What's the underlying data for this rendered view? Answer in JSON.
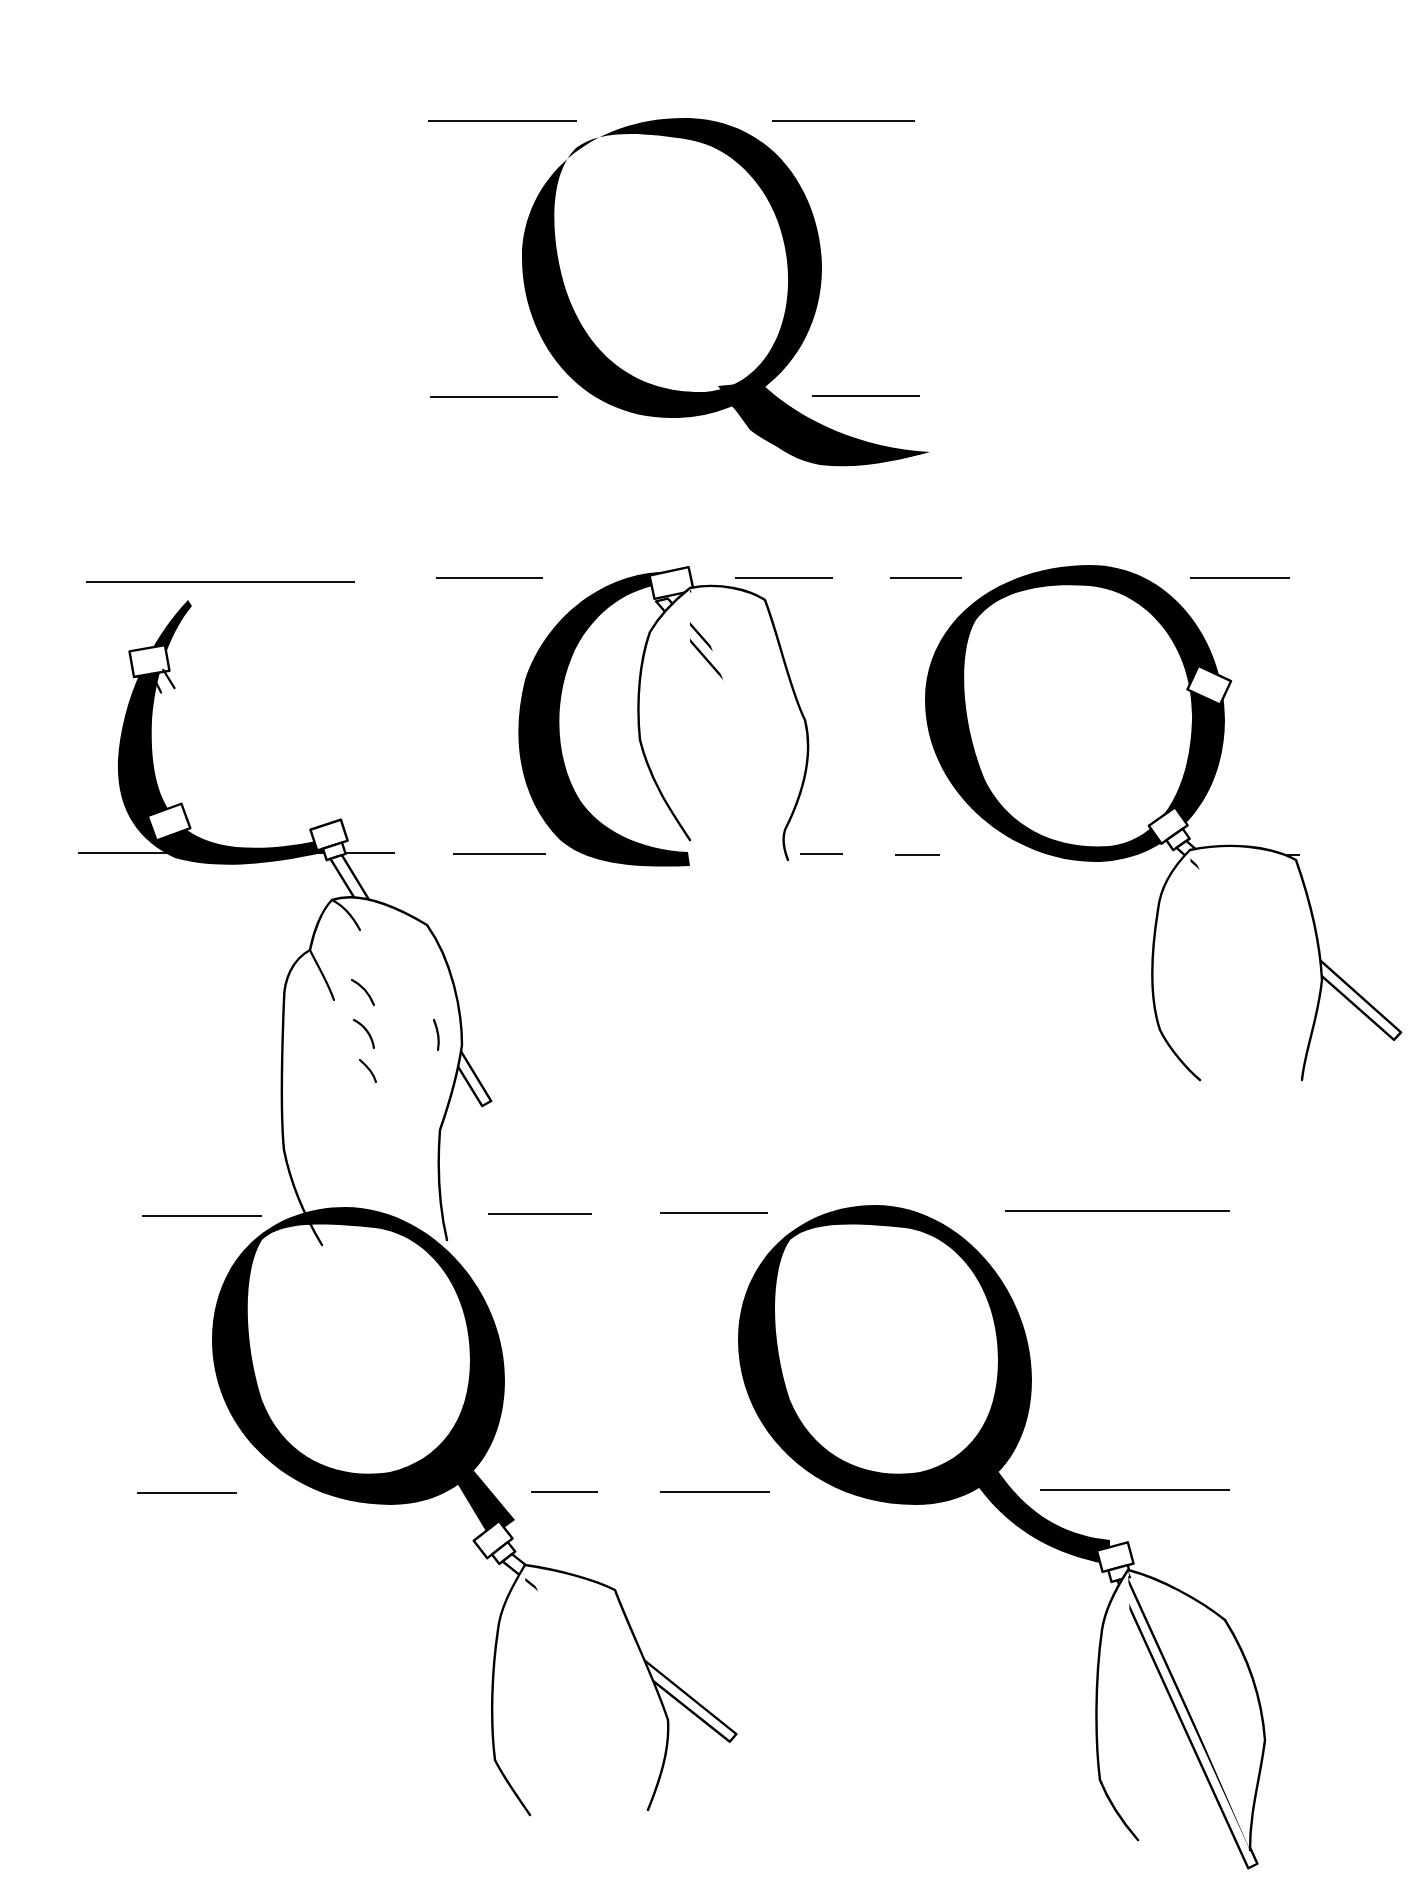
{
  "illustration": {
    "subject": "Calligraphy letter Q construction with broad-edge pen",
    "colors": {
      "ink": "#000000",
      "paper": "#ffffff",
      "guide": "#111111"
    },
    "final_letter": {
      "letter": "Q"
    },
    "steps": [
      {
        "id": 1,
        "row": 1,
        "description": "Left bowl stroke (first curve)"
      },
      {
        "id": 2,
        "row": 1,
        "description": "Left bowl complete"
      },
      {
        "id": 3,
        "row": 1,
        "description": "Right bowl stroke closing the O"
      },
      {
        "id": 4,
        "row": 2,
        "description": "Tail begins from base of bowl"
      },
      {
        "id": 5,
        "row": 2,
        "description": "Tail stroke completed"
      }
    ]
  }
}
